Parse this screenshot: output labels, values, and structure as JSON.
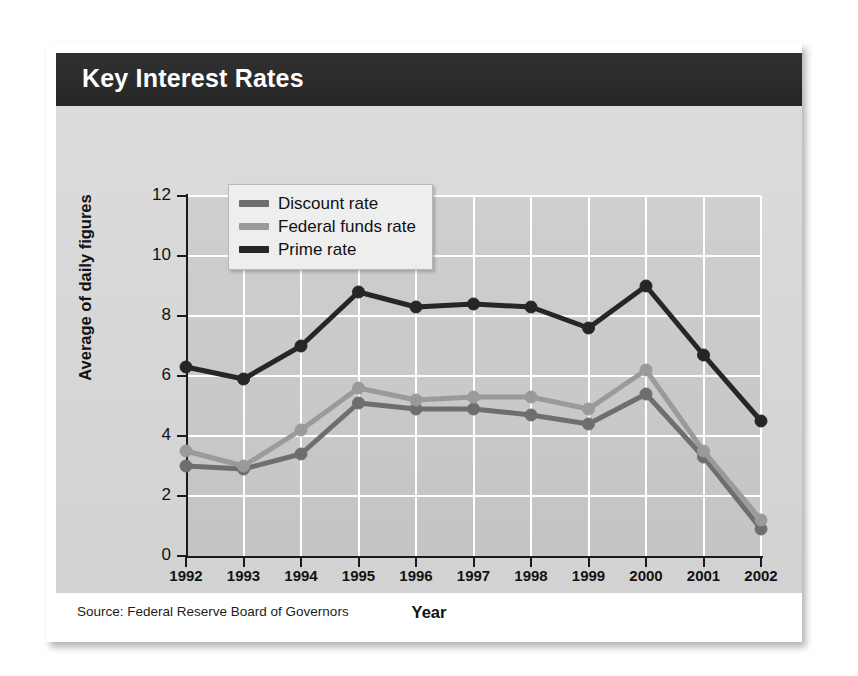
{
  "card": {
    "title": "Key Interest Rates",
    "source": "Source: Federal Reserve Board of Governors"
  },
  "colors": {
    "header_band": "#2b2b2b",
    "card_background": "#ffffff",
    "plot_background": "#c9c9c9",
    "gridline": "#ffffff",
    "axis": "#1a1a1a",
    "discount_rate": "#6e6e6e",
    "federal_funds_rate": "#9a9a9a",
    "prime_rate": "#262626"
  },
  "legend": {
    "position": "top-left-inside",
    "entries": [
      {
        "label": "Discount rate",
        "color": "#6e6e6e"
      },
      {
        "label": "Federal funds rate",
        "color": "#9a9a9a"
      },
      {
        "label": "Prime rate",
        "color": "#262626"
      }
    ]
  },
  "chart_data": {
    "type": "line",
    "title": "Key Interest Rates",
    "xlabel": "Year",
    "ylabel": "Average of daily figures",
    "categories": [
      "1992",
      "1993",
      "1994",
      "1995",
      "1996",
      "1997",
      "1998",
      "1999",
      "2000",
      "2001",
      "2002"
    ],
    "x": [
      1992,
      1993,
      1994,
      1995,
      1996,
      1997,
      1998,
      1999,
      2000,
      2001,
      2002
    ],
    "xlim": [
      1992,
      2002
    ],
    "ylim": [
      0,
      12
    ],
    "yticks": [
      0,
      2,
      4,
      6,
      8,
      10,
      12
    ],
    "xticks": [
      "1992",
      "1993",
      "1994",
      "1995",
      "1996",
      "1997",
      "1998",
      "1999",
      "2000",
      "2001",
      "2002"
    ],
    "grid": true,
    "markers": true,
    "series": [
      {
        "name": "Discount rate",
        "color": "#6e6e6e",
        "values": [
          3.0,
          2.9,
          3.4,
          5.1,
          4.9,
          4.9,
          4.7,
          4.4,
          5.4,
          3.3,
          0.9
        ]
      },
      {
        "name": "Federal funds rate",
        "color": "#9a9a9a",
        "values": [
          3.5,
          3.0,
          4.2,
          5.6,
          5.2,
          5.3,
          5.3,
          4.9,
          6.2,
          3.5,
          1.2
        ]
      },
      {
        "name": "Prime rate",
        "color": "#262626",
        "values": [
          6.3,
          5.9,
          7.0,
          8.8,
          8.3,
          8.4,
          8.3,
          7.6,
          9.0,
          6.7,
          4.5
        ]
      }
    ],
    "source": "Source: Federal Reserve Board of Governors"
  }
}
